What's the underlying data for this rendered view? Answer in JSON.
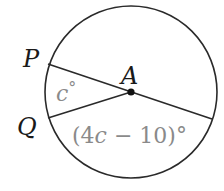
{
  "diagram": {
    "type": "circle-central-angles",
    "colors": {
      "stroke": "#2a2a2a",
      "label": "#1a1a1a",
      "angle_label": "#8a8a8a",
      "background": "#ffffff"
    },
    "circle": {
      "center": {
        "label": "A",
        "x": 131,
        "y": 92
      },
      "radius": 86
    },
    "points": [
      {
        "label": "P",
        "x": 48,
        "y": 64
      },
      {
        "label": "Q",
        "x": 48,
        "y": 118
      }
    ],
    "segments": [
      {
        "from": "P",
        "to": "A",
        "extends_to": [
          212,
          119
        ]
      },
      {
        "from": "Q",
        "to": "A"
      }
    ],
    "labels": {
      "P": "P",
      "Q": "Q",
      "A": "A"
    },
    "angles": {
      "small": {
        "var": "c",
        "text": "c°",
        "between": [
          "P",
          "Q"
        ]
      },
      "large": {
        "text": "(4c − 10)°",
        "expr_prefix": "(4",
        "var": "c",
        "expr_suffix": " − 10)°"
      }
    }
  }
}
